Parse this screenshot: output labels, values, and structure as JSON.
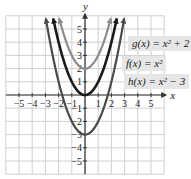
{
  "chart_data": {
    "type": "line",
    "title": "",
    "xlabel": "x",
    "ylabel": "y",
    "xlim": [
      -6,
      6
    ],
    "ylim": [
      -6,
      6
    ],
    "grid": true,
    "x_ticks": [
      -5,
      -4,
      -3,
      -2,
      -1,
      1,
      2,
      3,
      4,
      5
    ],
    "y_ticks": [
      -5,
      -4,
      -3,
      -2,
      -1,
      1,
      2,
      3,
      4,
      5
    ],
    "series": [
      {
        "name": "g(x) = x² + 2",
        "expr": "x^2 + 2",
        "shift": 2,
        "color": "#8c8c8c",
        "width": 2.2
      },
      {
        "name": "f(x) = x²",
        "expr": "x^2",
        "shift": 0,
        "color": "#1a1a1a",
        "width": 2.6
      },
      {
        "name": "h(x) = x² − 3",
        "expr": "x^2 - 3",
        "shift": -3,
        "color": "#4a4a4a",
        "width": 2.2
      }
    ],
    "legend": [
      {
        "text": "g(x) = x² + 2",
        "series": 0
      },
      {
        "text": "f(x) = x²",
        "series": 1
      },
      {
        "text": "h(x) = x² − 3",
        "series": 2
      }
    ]
  },
  "colors": {
    "grid": "#cfcfcf",
    "axis": "#333333",
    "label_bg": "#e6e6e6"
  },
  "geometry": {
    "origin_x": 85,
    "origin_y": 95,
    "unit": 13.2
  }
}
